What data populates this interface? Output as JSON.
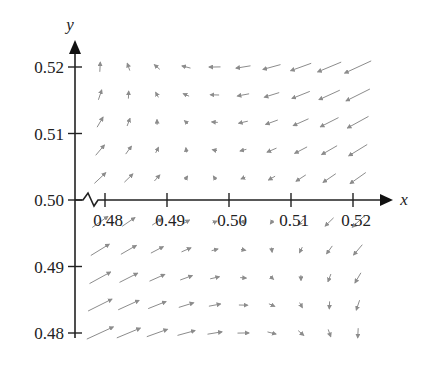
{
  "chart_data": {
    "type": "quiver",
    "title": "",
    "xlabel": "x",
    "ylabel": "y",
    "xlim": [
      0.4775,
      0.5225
    ],
    "ylim": [
      0.4775,
      0.5225
    ],
    "x_ticks": [
      0.48,
      0.49,
      0.5,
      0.51,
      0.52
    ],
    "x_tick_labels": [
      "0.48",
      "0.49",
      "0.50",
      "0.51",
      "0.52"
    ],
    "y_ticks": [
      0.48,
      0.49,
      0.5,
      0.51,
      0.52
    ],
    "y_tick_labels": [
      "0.48",
      "0.49",
      "0.50",
      "0.51",
      "0.52"
    ],
    "axis_break": "zigzag on x-axis near origin",
    "grid": false,
    "legend": null,
    "arrow_color": "#8c8c8c",
    "grid_x": [
      0.4792,
      0.4838,
      0.4884,
      0.4931,
      0.4977,
      0.5023,
      0.5069,
      0.5116,
      0.5162,
      0.5208
    ],
    "grid_y": [
      0.52,
      0.5158,
      0.5117,
      0.5075,
      0.5033,
      0.4967,
      0.4925,
      0.4883,
      0.4842,
      0.48
    ],
    "vector_model": "u = -(dx+dy)*k, v = -0.45*(dx+dy)*k + 0.35*(dy-dx)*k, with dx=x-0.5, dy=y-0.5",
    "vector_scale_px": 26
  }
}
